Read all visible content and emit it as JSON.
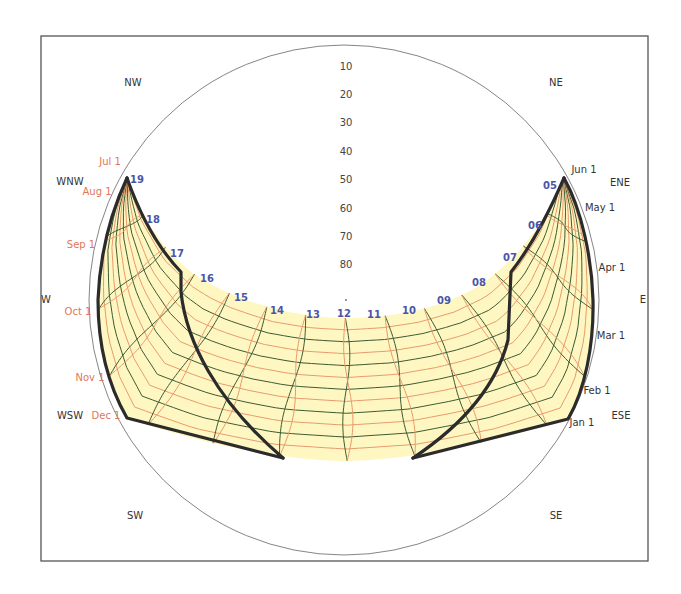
{
  "chart_data": {
    "type": "sun-path-diagram",
    "title": "",
    "projection": "polar / stereographic sky chart",
    "frame": {
      "x0": 41,
      "y0": 36,
      "x1": 648,
      "y1": 561
    },
    "horizon": {
      "cx": 344,
      "cy": 300,
      "r": 255
    },
    "compass_labels": [
      {
        "label": "NW",
        "x": 133,
        "y": 86
      },
      {
        "label": "NE",
        "x": 556,
        "y": 86
      },
      {
        "label": "WNW",
        "x": 70,
        "y": 185
      },
      {
        "label": "ENE",
        "x": 620,
        "y": 186
      },
      {
        "label": "W",
        "x": 46,
        "y": 303
      },
      {
        "label": "E",
        "x": 643,
        "y": 303
      },
      {
        "label": "WSW",
        "x": 70,
        "y": 419
      },
      {
        "label": "ESE",
        "x": 621,
        "y": 419
      },
      {
        "label": "SW",
        "x": 135,
        "y": 519
      },
      {
        "label": "SE",
        "x": 556,
        "y": 519
      }
    ],
    "altitude_labels": [
      {
        "label": "10",
        "y": 70
      },
      {
        "label": "20",
        "y": 98
      },
      {
        "label": "30",
        "y": 126
      },
      {
        "label": "40",
        "y": 155
      },
      {
        "label": "50",
        "y": 183
      },
      {
        "label": "60",
        "y": 212
      },
      {
        "label": "70",
        "y": 240
      },
      {
        "label": "80",
        "y": 268
      }
    ],
    "hour_labels": [
      {
        "label": "19",
        "x": 137,
        "y": 183
      },
      {
        "label": "18",
        "x": 153,
        "y": 223
      },
      {
        "label": "17",
        "x": 177,
        "y": 257
      },
      {
        "label": "16",
        "x": 207,
        "y": 282
      },
      {
        "label": "15",
        "x": 241,
        "y": 301
      },
      {
        "label": "14",
        "x": 277,
        "y": 314
      },
      {
        "label": "13",
        "x": 313,
        "y": 318
      },
      {
        "label": "12",
        "x": 344,
        "y": 317
      },
      {
        "label": "11",
        "x": 374,
        "y": 318
      },
      {
        "label": "10",
        "x": 409,
        "y": 314
      },
      {
        "label": "09",
        "x": 444,
        "y": 304
      },
      {
        "label": "08",
        "x": 479,
        "y": 286
      },
      {
        "label": "07",
        "x": 510,
        "y": 261
      },
      {
        "label": "06",
        "x": 535,
        "y": 229
      },
      {
        "label": "05",
        "x": 550,
        "y": 189
      }
    ],
    "month_labels_left": [
      {
        "label": "Jul 1",
        "x": 110,
        "y": 165
      },
      {
        "label": "Aug 1",
        "x": 97,
        "y": 195
      },
      {
        "label": "Sep 1",
        "x": 81,
        "y": 248
      },
      {
        "label": "Oct 1",
        "x": 78,
        "y": 315
      },
      {
        "label": "Nov 1",
        "x": 90,
        "y": 381
      },
      {
        "label": "Dec 1",
        "x": 106,
        "y": 419
      }
    ],
    "month_labels_right": [
      {
        "label": "Jun 1",
        "x": 584,
        "y": 173
      },
      {
        "label": "May 1",
        "x": 600,
        "y": 211
      },
      {
        "label": "Apr 1",
        "x": 612,
        "y": 271
      },
      {
        "label": "Mar 1",
        "x": 611,
        "y": 339
      },
      {
        "label": "Feb 1",
        "x": 597,
        "y": 394
      },
      {
        "label": "Jan 1",
        "x": 582,
        "y": 426
      }
    ],
    "band_outer_path": "M127,178 C112,210 100,250 98,300 C98,345 108,385 127,418 C190,440 270,460 346,461 C420,460 500,440 568,419 C585,390 594,345 593,300 C592,260 582,210 564,178 C545,225 515,260 482,284 C440,310 390,318 346,318 C300,318 245,305 200,278 C165,255 140,215 127,178 Z",
    "inner_arc": [
      [
        127,
        178
      ],
      [
        145,
        218
      ],
      [
        170,
        254
      ],
      [
        200,
        278
      ],
      [
        238,
        297
      ],
      [
        276,
        310
      ],
      [
        312,
        316
      ],
      [
        346,
        318
      ],
      [
        380,
        316
      ],
      [
        414,
        311
      ],
      [
        448,
        301
      ],
      [
        482,
        284
      ],
      [
        510,
        262
      ],
      [
        535,
        230
      ],
      [
        557,
        186
      ],
      [
        564,
        178
      ]
    ],
    "outer_bottom": [
      [
        127,
        418
      ],
      [
        190,
        440
      ],
      [
        270,
        456
      ],
      [
        346,
        461
      ],
      [
        420,
        456
      ],
      [
        500,
        440
      ],
      [
        568,
        419
      ]
    ],
    "outline_left_outer": "M127,178 C112,210 100,250 98,300 C98,345 108,385 127,418 L283,458",
    "outline_left_inner": "M127,178 C140,215 158,248 181,272 L181,292 C186,340 215,400 283,458",
    "outline_right_outer": "M564,178 C582,210 592,260 593,300 C594,345 585,390 568,419 L413,458",
    "outline_right_inner": "M564,178 C548,215 530,248 511,272 L508,340 C498,380 470,420 413,458",
    "colors": {
      "fill": "#fff7c2",
      "hour_lines": "#3d5a33",
      "date_lines": "#e79a6c",
      "outline": "#2b2b2b",
      "hour_labels": "#4a55a8",
      "month_labels_left": "#e3765a",
      "month_labels_right": "#333333"
    }
  }
}
